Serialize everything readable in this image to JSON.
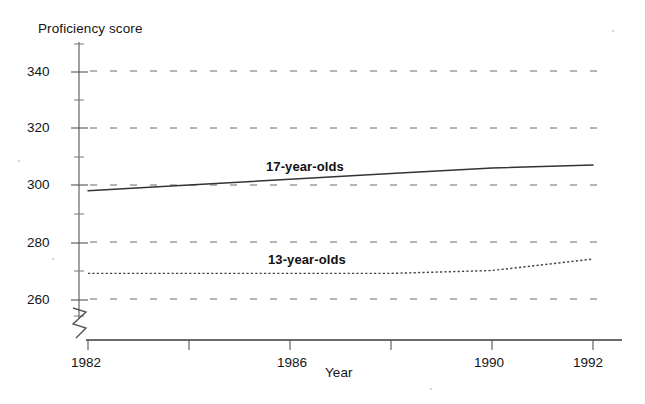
{
  "chart_data": {
    "type": "line",
    "title": "",
    "xlabel": "Year",
    "ylabel": "Proficiency score",
    "x": [
      1982,
      1984,
      1986,
      1988,
      1990,
      1992
    ],
    "xlim": [
      1982,
      1992
    ],
    "ylim": [
      255,
      345
    ],
    "y_ticks": [
      260,
      280,
      300,
      320,
      340
    ],
    "y_tick_labels": [
      "260",
      "280",
      "300",
      "320",
      "340"
    ],
    "y_minor_ticks": [
      270,
      290,
      310,
      330
    ],
    "x_ticks": [
      1982,
      1984,
      1986,
      1988,
      1990,
      1992
    ],
    "x_tick_labels": [
      "1982",
      "",
      "1986",
      "",
      "1990",
      "1992"
    ],
    "grid": "horizontal-dashed",
    "axis_break": true,
    "legend": "inline-labels",
    "series": [
      {
        "name": "17-year-olds",
        "style": "solid",
        "color": "#333333",
        "values": [
          298,
          300,
          302,
          304,
          306,
          307
        ]
      },
      {
        "name": "13-year-olds",
        "style": "dotted",
        "color": "#444444",
        "values": [
          269,
          269,
          269,
          269,
          270,
          274
        ]
      }
    ]
  },
  "axes": {
    "y_title": "Proficiency score",
    "x_title": "Year",
    "y_tick_260": "260",
    "y_tick_280": "280",
    "y_tick_300": "300",
    "y_tick_320": "320",
    "y_tick_340": "340",
    "x_tick_1982": "1982",
    "x_tick_1986": "1986",
    "x_tick_1990": "1990",
    "x_tick_1992": "1992"
  },
  "series_labels": {
    "upper": "17-year-olds",
    "lower": "13-year-olds"
  }
}
